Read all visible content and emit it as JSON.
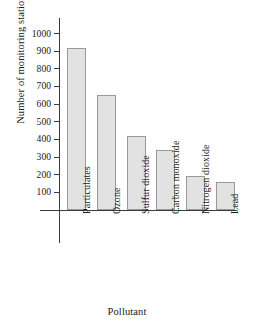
{
  "chart_data": {
    "type": "bar",
    "title": "",
    "xlabel": "Pollutant",
    "ylabel": "Number of monitoring stations",
    "categories": [
      "Particulates",
      "Ozone",
      "Sulfur dioxide",
      "Carbon monoxide",
      "Nitrogen dioxide",
      "Lead"
    ],
    "values": [
      920,
      650,
      420,
      340,
      195,
      160
    ],
    "ylim": [
      0,
      1050
    ],
    "yticks": [
      100,
      200,
      300,
      400,
      500,
      600,
      700,
      800,
      900,
      1000
    ],
    "ytick_labels": [
      "100",
      "200",
      "300",
      "400",
      "500",
      "600",
      "700",
      "800",
      "900",
      "1000"
    ],
    "grid": false,
    "legend": false,
    "bar_fill": "#e2e2e2",
    "bar_edge": "#9a9a9a",
    "axis_color": "#3b3b3b",
    "background": "#ffffff",
    "xtick_rotation": -90
  }
}
